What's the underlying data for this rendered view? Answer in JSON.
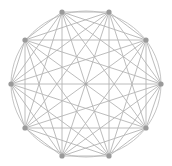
{
  "diagram": {
    "type": "complete-graph",
    "title": "",
    "node_count": 10,
    "layout": "circular",
    "center": [
      86,
      84
    ],
    "radius_x": 75,
    "radius_y": 72,
    "start_angle_deg": 0,
    "nodes": [
      {
        "id": 0,
        "x": 161,
        "y": 84
      },
      {
        "id": 1,
        "x": 146,
        "y": 40
      },
      {
        "id": 2,
        "x": 109,
        "y": 12
      },
      {
        "id": 3,
        "x": 62,
        "y": 12
      },
      {
        "id": 4,
        "x": 25,
        "y": 40
      },
      {
        "id": 5,
        "x": 11,
        "y": 84
      },
      {
        "id": 6,
        "x": 25,
        "y": 128
      },
      {
        "id": 7,
        "x": 62,
        "y": 156
      },
      {
        "id": 8,
        "x": 109,
        "y": 156
      },
      {
        "id": 9,
        "x": 146,
        "y": 128
      }
    ],
    "edges": "all-pairs",
    "show_outer_circle": true,
    "show_center_point": true,
    "colors": {
      "edge": "#b4b4b4",
      "ring": "#bcbcbc",
      "node": "#9a9a9a",
      "background": "#ffffff"
    }
  }
}
